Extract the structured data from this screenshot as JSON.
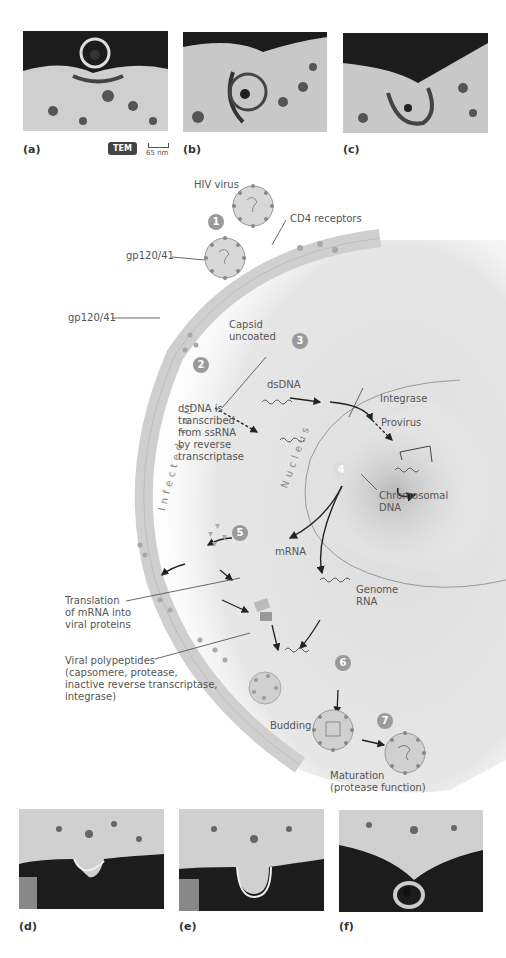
{
  "top_micrographs": [
    {
      "label": "(a)"
    },
    {
      "label": "(b)"
    },
    {
      "label": "(c)"
    }
  ],
  "bottom_micrographs": [
    {
      "label": "(d)"
    },
    {
      "label": "(e)"
    },
    {
      "label": "(f)"
    }
  ],
  "tem_badge": "TEM",
  "scale_bar": "65 nm",
  "steps": [
    "1",
    "2",
    "3",
    "4",
    "5",
    "6",
    "7"
  ],
  "labels": {
    "hiv_virus": "HIV virus",
    "cd4_receptors": "CD4 receptors",
    "gp120_top": "gp120/41",
    "gp120_mid": "gp120/41",
    "capsid": [
      "Capsid",
      "uncoated"
    ],
    "dsdna": "dsDNA",
    "dsdna_transcribed": [
      "dsDNA is",
      "transcribed",
      "from ssRNA",
      "by reverse",
      "transcriptase"
    ],
    "integrase": "Integrase",
    "provirus": "Provirus",
    "chromosomal": [
      "Chromosomal",
      "DNA"
    ],
    "infected_cell": "Infected cell",
    "nucleus": "Nucleus",
    "mrna": "mRNA",
    "genome_rna": [
      "Genome",
      "RNA"
    ],
    "translation": [
      "Translation",
      "of mRNA into",
      "viral proteins"
    ],
    "polypeptides": [
      "Viral polypeptides",
      "(capsomere, protease,",
      "inactive reverse transcriptase,",
      "integrase)"
    ],
    "budding": "Budding",
    "maturation": [
      "Maturation",
      "(protease function)"
    ]
  }
}
